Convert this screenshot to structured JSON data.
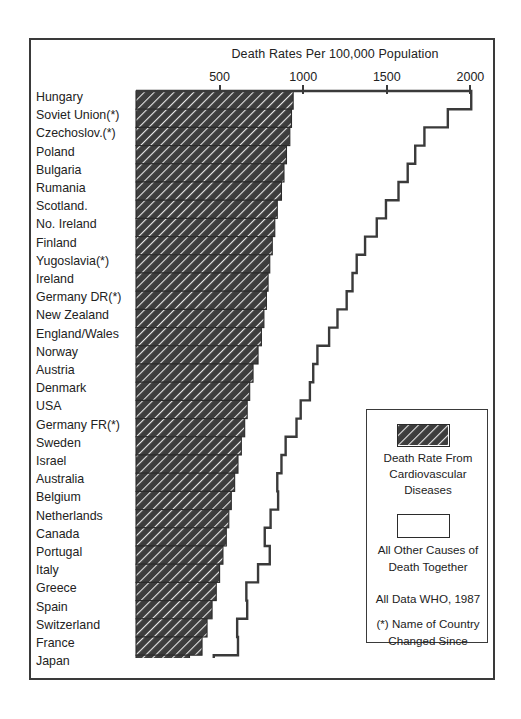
{
  "chart_data": {
    "type": "bar",
    "title": "Death Rates Per 100,000 Population",
    "subtype": "stacked-horizontal-bar",
    "xlabel": "Death Rates Per 100,000 Population",
    "ylabel": "",
    "xlim": [
      0,
      2100
    ],
    "ticks": [
      500,
      1000,
      1500,
      2000
    ],
    "grid": false,
    "legend_position": "inside-right-bottom",
    "categories": [
      "Hungary",
      "Soviet Union(*)",
      "Czechoslov.(*)",
      "Poland",
      "Bulgaria",
      "Rumania",
      "Scotland.",
      "No. Ireland",
      "Finland",
      "Yugoslavia(*)",
      "Ireland",
      "Germany DR(*)",
      "New Zealand",
      "England/Wales",
      "Norway",
      "Austria",
      "Denmark",
      "USA",
      "Germany FR(*)",
      "Sweden",
      "Israel",
      "Australia",
      "Belgium",
      "Netherlands",
      "Canada",
      "Portugal",
      "Italy",
      "Greece",
      "Spain",
      "Switzerland",
      "France",
      "Japan"
    ],
    "series": [
      {
        "name": "Death Rate From Cardiovascular Diseases",
        "values": [
          940,
          930,
          920,
          900,
          885,
          870,
          845,
          830,
          815,
          800,
          790,
          780,
          765,
          750,
          730,
          700,
          680,
          665,
          650,
          630,
          610,
          590,
          570,
          555,
          540,
          520,
          500,
          480,
          455,
          425,
          395,
          320
        ]
      },
      {
        "name": "All Other Causes of Death Together",
        "values": [
          1065,
          935,
          805,
          770,
          740,
          700,
          650,
          610,
          555,
          520,
          505,
          480,
          440,
          405,
          355,
          360,
          360,
          320,
          310,
          265,
          260,
          255,
          280,
          250,
          230,
          280,
          230,
          180,
          210,
          180,
          215,
          145
        ]
      }
    ],
    "totals": [
      2005,
      1865,
      1725,
      1670,
      1625,
      1570,
      1495,
      1440,
      1370,
      1320,
      1295,
      1260,
      1205,
      1155,
      1085,
      1060,
      1040,
      985,
      960,
      895,
      870,
      845,
      850,
      805,
      770,
      800,
      730,
      660,
      665,
      605,
      610,
      465
    ]
  },
  "axis": {
    "title": "Death Rates Per 100,000 Population",
    "tick_labels": [
      "500",
      "1000",
      "1500",
      "2000"
    ]
  },
  "legend": {
    "hatch_swatch_name": "cardiovascular-swatch",
    "open_swatch_name": "other-causes-swatch",
    "lines": [
      "Death Rate From",
      "Cardiovascular",
      "Diseases",
      "All Other Causes of",
      "Death Together",
      "All  Data  WHO, 1987",
      "(*) Name of Country",
      "Changed Since"
    ]
  }
}
